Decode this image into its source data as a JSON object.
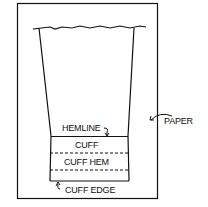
{
  "diagram": {
    "title": "",
    "labels": {
      "hemline": "HEMLINE",
      "cuff": "CUFF",
      "cuff_hem": "CUFF HEM",
      "cuff_edge": "CUFF EDGE",
      "paper": "PAPER"
    },
    "colors": {
      "ink": "#111111",
      "background": "#ffffff"
    }
  }
}
